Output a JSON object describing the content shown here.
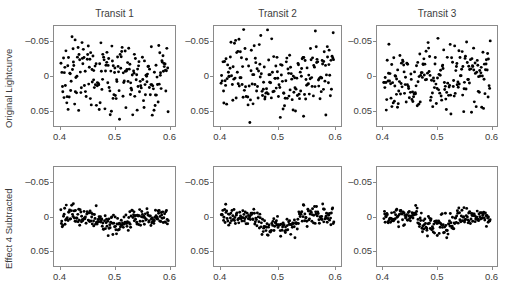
{
  "figure": {
    "suptitle": "",
    "background": "#ffffff",
    "marker_color": "#000000",
    "frame_color": "#8a8a8a"
  },
  "row_labels": [
    "Original Lightcurve",
    "Effect 4 Subtracted"
  ],
  "column_titles": [
    "Transit 1",
    "Transit 2",
    "Transit 3"
  ],
  "axis": {
    "xticks": [
      "0.4",
      "0.5",
      "0.6"
    ],
    "yticks": [
      "-0.05",
      "0",
      "0.05"
    ],
    "xlim": [
      0.39,
      0.61
    ],
    "ylim_display_top": -0.072,
    "ylim_display_bottom": 0.072,
    "y_inverted": true
  },
  "chart_data": {
    "type": "scatter",
    "title": "",
    "xlabel": "",
    "ylabel": "Relative magnitude",
    "grid": false,
    "legend": "none",
    "y_inverted": true,
    "xlim": [
      0.39,
      0.61
    ],
    "ylim": [
      0.072,
      -0.072
    ],
    "xticks": [
      0.4,
      0.5,
      0.6
    ],
    "yticks": [
      -0.05,
      0,
      0.05
    ],
    "panels": [
      {
        "row": 0,
        "col": 0,
        "row_label": "Original Lightcurve",
        "title": "Transit 1",
        "n_points": 205,
        "scatter_sigma": 0.028,
        "transit_depth": 0.006,
        "transit_center": 0.5,
        "transit_half_width": 0.035,
        "seed": 11
      },
      {
        "row": 0,
        "col": 1,
        "row_label": "Original Lightcurve",
        "title": "Transit 2",
        "n_points": 205,
        "scatter_sigma": 0.026,
        "transit_depth": 0.006,
        "transit_center": 0.5,
        "transit_half_width": 0.035,
        "seed": 23
      },
      {
        "row": 0,
        "col": 2,
        "row_label": "Original Lightcurve",
        "title": "Transit 3",
        "n_points": 205,
        "scatter_sigma": 0.027,
        "transit_depth": 0.006,
        "transit_center": 0.5,
        "transit_half_width": 0.035,
        "seed": 37
      },
      {
        "row": 1,
        "col": 0,
        "row_label": "Effect 4 Subtracted",
        "title": "Transit 1",
        "n_points": 205,
        "scatter_sigma": 0.0072,
        "transit_depth": 0.011,
        "transit_center": 0.5,
        "transit_half_width": 0.036,
        "seed": 52
      },
      {
        "row": 1,
        "col": 1,
        "row_label": "Effect 4 Subtracted",
        "title": "Transit 2",
        "n_points": 205,
        "scatter_sigma": 0.007,
        "transit_depth": 0.013,
        "transit_center": 0.5,
        "transit_half_width": 0.037,
        "seed": 68
      },
      {
        "row": 1,
        "col": 2,
        "row_label": "Effect 4 Subtracted",
        "title": "Transit 3",
        "n_points": 205,
        "scatter_sigma": 0.007,
        "transit_depth": 0.013,
        "transit_center": 0.5,
        "transit_half_width": 0.037,
        "seed": 84
      }
    ]
  }
}
